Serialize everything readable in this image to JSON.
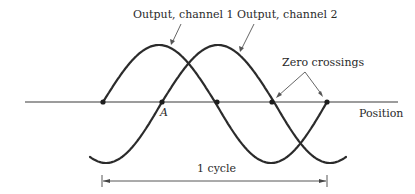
{
  "diagram": {
    "title": "",
    "colors": {
      "curve": "#2b2b2b",
      "axis": "#3a3a3a",
      "pointer": "#555555",
      "text": "#2a2a2a",
      "background": "#ffffff"
    },
    "axis": {
      "label": "Position",
      "y": 102,
      "x_start": 25,
      "x_end": 398
    },
    "channels": [
      {
        "name": "Output, channel 1",
        "phase_zero_rising_x": 103,
        "x_start": 103,
        "x_end": 327,
        "peak_y": 45,
        "trough_y": 163
      },
      {
        "name": "Output, channel 2",
        "phase_zero_rising_x": 162,
        "x_start": 90,
        "x_end": 346,
        "peak_y": 45,
        "trough_y": 163
      }
    ],
    "period_px": 224,
    "zero_crossings": {
      "label": "Zero crossings",
      "points_x": [
        103,
        162,
        217,
        272,
        327
      ]
    },
    "point_label": "A",
    "cycle": {
      "label": "1 cycle",
      "x_start": 102,
      "x_end": 327,
      "y": 181
    },
    "labels": {
      "channel1": "Output, channel 1",
      "channel2": "Output, channel 2",
      "zero_crossings": "Zero crossings",
      "position": "Position",
      "point_a": "A",
      "cycle": "1 cycle"
    }
  }
}
